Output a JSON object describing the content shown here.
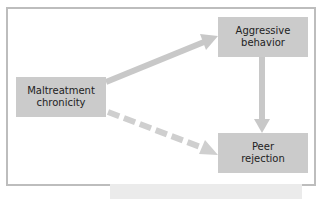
{
  "diagram": {
    "type": "path-model",
    "nodes": [
      {
        "id": "maltreatment",
        "lines": [
          "Maltreatment",
          "chronicity"
        ]
      },
      {
        "id": "aggressive",
        "lines": [
          "Aggressive",
          "behavior"
        ]
      },
      {
        "id": "peer",
        "lines": [
          "Peer",
          "rejection"
        ]
      }
    ],
    "edges": [
      {
        "from": "maltreatment",
        "to": "aggressive",
        "style": "solid"
      },
      {
        "from": "aggressive",
        "to": "peer",
        "style": "solid"
      },
      {
        "from": "maltreatment",
        "to": "peer",
        "style": "dashed"
      }
    ],
    "colors": {
      "box_fill": "#cbcbcb",
      "arrow": "#c8c8c8",
      "frame_border": "#bdbdbd",
      "text": "#222222"
    }
  }
}
